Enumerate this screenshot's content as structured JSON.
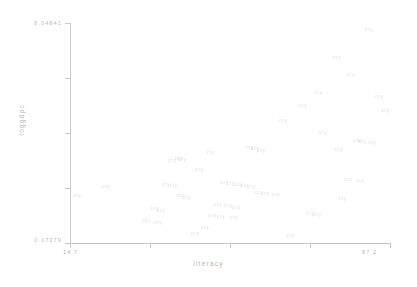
{
  "chart_data": {
    "type": "scatter",
    "title": "",
    "xlabel": "literacy",
    "ylabel": "loggdpc",
    "xlim": [
      14.7,
      87.2
    ],
    "ylim": [
      0.17379,
      9.04841
    ],
    "x_ticks": [
      "14.7",
      "87.2"
    ],
    "y_ticks": [
      "9.04841",
      "0.17379"
    ],
    "grid": false,
    "legend": null,
    "marker_color": "#dcdcdc",
    "axis_color": "#c9c9c9",
    "label_color": "#b5b5b5",
    "points": [
      {
        "label": "cty",
        "x": 82.5,
        "y": 8.78
      },
      {
        "label": "cty",
        "x": 75.2,
        "y": 7.62
      },
      {
        "label": "cty",
        "x": 78.4,
        "y": 6.95
      },
      {
        "label": "cty",
        "x": 71.0,
        "y": 6.22
      },
      {
        "label": "cty",
        "x": 84.8,
        "y": 6.05
      },
      {
        "label": "cty",
        "x": 63.0,
        "y": 5.08
      },
      {
        "label": "cty",
        "x": 72.1,
        "y": 4.62
      },
      {
        "label": "cty",
        "x": 79.9,
        "y": 4.3
      },
      {
        "label": "cty",
        "x": 81.0,
        "y": 4.25
      },
      {
        "label": "cty",
        "x": 83.3,
        "y": 4.2
      },
      {
        "label": "cty",
        "x": 75.6,
        "y": 3.92
      },
      {
        "label": "cty",
        "x": 55.4,
        "y": 4.02
      },
      {
        "label": "cty",
        "x": 56.7,
        "y": 3.95
      },
      {
        "label": "cty",
        "x": 58.1,
        "y": 3.88
      },
      {
        "label": "cty",
        "x": 46.6,
        "y": 3.8
      },
      {
        "label": "cty",
        "x": 39.4,
        "y": 3.58
      },
      {
        "label": "cty",
        "x": 40.2,
        "y": 3.52
      },
      {
        "label": "cty",
        "x": 37.9,
        "y": 3.48
      },
      {
        "label": "cty",
        "x": 44.0,
        "y": 3.1
      },
      {
        "label": "cty",
        "x": 77.8,
        "y": 2.72
      },
      {
        "label": "cty",
        "x": 80.5,
        "y": 2.66
      },
      {
        "label": "cty",
        "x": 49.7,
        "y": 2.6
      },
      {
        "label": "cty",
        "x": 51.1,
        "y": 2.56
      },
      {
        "label": "cty",
        "x": 53.0,
        "y": 2.52
      },
      {
        "label": "cty",
        "x": 54.3,
        "y": 2.48
      },
      {
        "label": "cty",
        "x": 55.9,
        "y": 2.44
      },
      {
        "label": "cty",
        "x": 36.5,
        "y": 2.5
      },
      {
        "label": "cty",
        "x": 38.2,
        "y": 2.46
      },
      {
        "label": "cty",
        "x": 22.8,
        "y": 2.42
      },
      {
        "label": "cty",
        "x": 57.6,
        "y": 2.2
      },
      {
        "label": "cty",
        "x": 59.0,
        "y": 2.16
      },
      {
        "label": "cty",
        "x": 61.4,
        "y": 2.12
      },
      {
        "label": "cty",
        "x": 39.8,
        "y": 2.05
      },
      {
        "label": "cty",
        "x": 41.2,
        "y": 2.0
      },
      {
        "label": "cty",
        "x": 16.4,
        "y": 2.08
      },
      {
        "label": "cty",
        "x": 76.5,
        "y": 1.95
      },
      {
        "label": "cty",
        "x": 48.2,
        "y": 1.72
      },
      {
        "label": "cty",
        "x": 50.6,
        "y": 1.66
      },
      {
        "label": "cty",
        "x": 52.4,
        "y": 1.6
      },
      {
        "label": "cty",
        "x": 33.9,
        "y": 1.55
      },
      {
        "label": "cty",
        "x": 35.4,
        "y": 1.48
      },
      {
        "label": "cty",
        "x": 47.0,
        "y": 1.28
      },
      {
        "label": "cty",
        "x": 49.0,
        "y": 1.22
      },
      {
        "label": "cty",
        "x": 51.8,
        "y": 1.18
      },
      {
        "label": "cty",
        "x": 69.2,
        "y": 1.35
      },
      {
        "label": "cty",
        "x": 70.8,
        "y": 1.3
      },
      {
        "label": "cty",
        "x": 32.1,
        "y": 1.05
      },
      {
        "label": "cty",
        "x": 34.7,
        "y": 1.0
      },
      {
        "label": "cty",
        "x": 45.3,
        "y": 0.78
      },
      {
        "label": "cty",
        "x": 43.1,
        "y": 0.52
      },
      {
        "label": "cty",
        "x": 64.7,
        "y": 0.45
      },
      {
        "label": "cty",
        "x": 86.2,
        "y": 5.48
      },
      {
        "label": "cty",
        "x": 67.5,
        "y": 5.72
      }
    ]
  }
}
